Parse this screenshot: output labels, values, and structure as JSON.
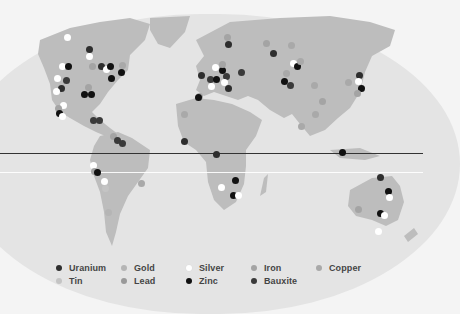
{
  "map": {
    "ocean_color": "#e4e4e4",
    "land_color": "#bdbdbd",
    "background_color": "#f4f4f4",
    "equator_color": "#333333"
  },
  "legend": {
    "items": [
      {
        "label": "Uranium",
        "color": "#2e2e2e"
      },
      {
        "label": "Gold",
        "color": "#b5b5b5"
      },
      {
        "label": "Silver",
        "color": "#ffffff"
      },
      {
        "label": "Iron",
        "color": "#a4a4a4"
      },
      {
        "label": "Copper",
        "color": "#a9a9a9"
      },
      {
        "label": "Tin",
        "color": "#c4c4c4"
      },
      {
        "label": "Lead",
        "color": "#999999"
      },
      {
        "label": "Zinc",
        "color": "#111111"
      },
      {
        "label": "Bauxite",
        "color": "#3a3a3a"
      }
    ]
  },
  "deposits": [
    {
      "x": 67,
      "y": 37,
      "type": "Silver"
    },
    {
      "x": 89,
      "y": 49,
      "type": "Uranium"
    },
    {
      "x": 89,
      "y": 56,
      "type": "Silver"
    },
    {
      "x": 62,
      "y": 66,
      "type": "Silver"
    },
    {
      "x": 68,
      "y": 66,
      "type": "Zinc"
    },
    {
      "x": 92,
      "y": 66,
      "type": "Iron"
    },
    {
      "x": 101,
      "y": 66,
      "type": "Uranium"
    },
    {
      "x": 106,
      "y": 69,
      "type": "Silver"
    },
    {
      "x": 110,
      "y": 66,
      "type": "Zinc"
    },
    {
      "x": 122,
      "y": 65,
      "type": "Copper"
    },
    {
      "x": 121,
      "y": 72,
      "type": "Zinc"
    },
    {
      "x": 111,
      "y": 78,
      "type": "Zinc"
    },
    {
      "x": 57,
      "y": 78,
      "type": "Silver"
    },
    {
      "x": 66,
      "y": 80,
      "type": "Bauxite"
    },
    {
      "x": 61,
      "y": 88,
      "type": "Uranium"
    },
    {
      "x": 56,
      "y": 91,
      "type": "Silver"
    },
    {
      "x": 84,
      "y": 94,
      "type": "Zinc"
    },
    {
      "x": 91,
      "y": 94,
      "type": "Zinc"
    },
    {
      "x": 88,
      "y": 87,
      "type": "Iron"
    },
    {
      "x": 63,
      "y": 105,
      "type": "Silver"
    },
    {
      "x": 58,
      "y": 108,
      "type": "Iron"
    },
    {
      "x": 59,
      "y": 113,
      "type": "Zinc"
    },
    {
      "x": 62,
      "y": 116,
      "type": "Silver"
    },
    {
      "x": 93,
      "y": 120,
      "type": "Bauxite"
    },
    {
      "x": 99,
      "y": 120,
      "type": "Bauxite"
    },
    {
      "x": 113,
      "y": 136,
      "type": "Iron"
    },
    {
      "x": 117,
      "y": 140,
      "type": "Bauxite"
    },
    {
      "x": 122,
      "y": 143,
      "type": "Bauxite"
    },
    {
      "x": 93,
      "y": 165,
      "type": "Silver"
    },
    {
      "x": 94,
      "y": 171,
      "type": "Iron"
    },
    {
      "x": 97,
      "y": 172,
      "type": "Zinc"
    },
    {
      "x": 104,
      "y": 181,
      "type": "Silver"
    },
    {
      "x": 105,
      "y": 188,
      "type": "Tin"
    },
    {
      "x": 141,
      "y": 183,
      "type": "Copper"
    },
    {
      "x": 108,
      "y": 212,
      "type": "Gold"
    },
    {
      "x": 227,
      "y": 37,
      "type": "Iron"
    },
    {
      "x": 228,
      "y": 44,
      "type": "Uranium"
    },
    {
      "x": 266,
      "y": 43,
      "type": "Iron"
    },
    {
      "x": 273,
      "y": 53,
      "type": "Uranium"
    },
    {
      "x": 215,
      "y": 67,
      "type": "Silver"
    },
    {
      "x": 222,
      "y": 70,
      "type": "Zinc"
    },
    {
      "x": 222,
      "y": 64,
      "type": "Iron"
    },
    {
      "x": 201,
      "y": 75,
      "type": "Uranium"
    },
    {
      "x": 210,
      "y": 79,
      "type": "Bauxite"
    },
    {
      "x": 216,
      "y": 79,
      "type": "Zinc"
    },
    {
      "x": 226,
      "y": 76,
      "type": "Bauxite"
    },
    {
      "x": 224,
      "y": 82,
      "type": "Silver"
    },
    {
      "x": 211,
      "y": 86,
      "type": "Silver"
    },
    {
      "x": 228,
      "y": 88,
      "type": "Uranium"
    },
    {
      "x": 241,
      "y": 72,
      "type": "Bauxite"
    },
    {
      "x": 199,
      "y": 96,
      "type": "Iron"
    },
    {
      "x": 198,
      "y": 97,
      "type": "Zinc"
    },
    {
      "x": 184,
      "y": 114,
      "type": "Copper"
    },
    {
      "x": 184,
      "y": 141,
      "type": "Uranium"
    },
    {
      "x": 291,
      "y": 45,
      "type": "Copper"
    },
    {
      "x": 293,
      "y": 63,
      "type": "Silver"
    },
    {
      "x": 297,
      "y": 66,
      "type": "Zinc"
    },
    {
      "x": 286,
      "y": 73,
      "type": "Copper"
    },
    {
      "x": 284,
      "y": 81,
      "type": "Zinc"
    },
    {
      "x": 290,
      "y": 85,
      "type": "Bauxite"
    },
    {
      "x": 300,
      "y": 61,
      "type": "Copper"
    },
    {
      "x": 314,
      "y": 85,
      "type": "Copper"
    },
    {
      "x": 322,
      "y": 101,
      "type": "Iron"
    },
    {
      "x": 315,
      "y": 114,
      "type": "Copper"
    },
    {
      "x": 301,
      "y": 126,
      "type": "Copper"
    },
    {
      "x": 359,
      "y": 75,
      "type": "Uranium"
    },
    {
      "x": 358,
      "y": 81,
      "type": "Silver"
    },
    {
      "x": 361,
      "y": 88,
      "type": "Zinc"
    },
    {
      "x": 357,
      "y": 93,
      "type": "Iron"
    },
    {
      "x": 348,
      "y": 82,
      "type": "Copper"
    },
    {
      "x": 216,
      "y": 154,
      "type": "Uranium"
    },
    {
      "x": 235,
      "y": 180,
      "type": "Zinc"
    },
    {
      "x": 221,
      "y": 187,
      "type": "Silver"
    },
    {
      "x": 233,
      "y": 195,
      "type": "Zinc"
    },
    {
      "x": 238,
      "y": 195,
      "type": "Silver"
    },
    {
      "x": 342,
      "y": 152,
      "type": "Zinc"
    },
    {
      "x": 380,
      "y": 177,
      "type": "Uranium"
    },
    {
      "x": 388,
      "y": 191,
      "type": "Zinc"
    },
    {
      "x": 389,
      "y": 197,
      "type": "Silver"
    },
    {
      "x": 380,
      "y": 213,
      "type": "Zinc"
    },
    {
      "x": 384,
      "y": 215,
      "type": "Silver"
    },
    {
      "x": 378,
      "y": 231,
      "type": "Silver"
    },
    {
      "x": 358,
      "y": 209,
      "type": "Iron"
    }
  ]
}
